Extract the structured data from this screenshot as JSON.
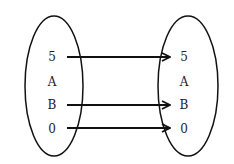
{
  "diagram": {
    "type": "mapping",
    "domain_set": {
      "elements": [
        "5",
        "A",
        "B",
        "0"
      ]
    },
    "codomain_set": {
      "elements": [
        "5",
        "A",
        "B",
        "0"
      ]
    },
    "arrows": [
      {
        "from": "5",
        "to": "5"
      },
      {
        "from": "B",
        "to": "B"
      },
      {
        "from": "0",
        "to": "0"
      }
    ],
    "colors": {
      "stroke": "#111111",
      "text": "#222222",
      "background": "#ffffff"
    }
  }
}
